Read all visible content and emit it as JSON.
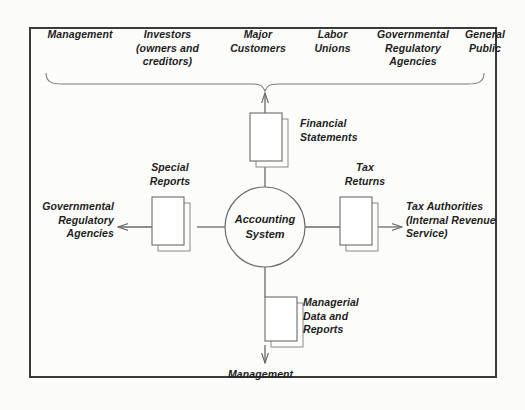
{
  "diagram": {
    "center_node": "Accounting System",
    "external_users_heading": [
      "Management",
      "Investors\n(owners and\ncreditors)",
      "Major\nCustomers",
      "Labor\nUnions",
      "Governmental\nRegulatory\nAgencies",
      "General\nPublic"
    ],
    "flows": {
      "top": {
        "document": "Financial\nStatements",
        "target": "external-users-brace",
        "direction": "up"
      },
      "left": {
        "document": "Special\nReports",
        "target": "Governmental\nRegulatory\nAgencies",
        "direction": "left"
      },
      "right": {
        "document": "Tax\nReturns",
        "target": "Tax Authorities\n(Internal Revenue\nService)",
        "direction": "right"
      },
      "bottom": {
        "document": "Managerial\nData and\nReports",
        "target": "Management",
        "direction": "down"
      }
    },
    "colors": {
      "background": "#fbfbf9",
      "frame_border": "#3a3a3a",
      "line": "#6b6b6b",
      "text": "#1d1d1d",
      "document_fill": "#ffffff"
    }
  }
}
